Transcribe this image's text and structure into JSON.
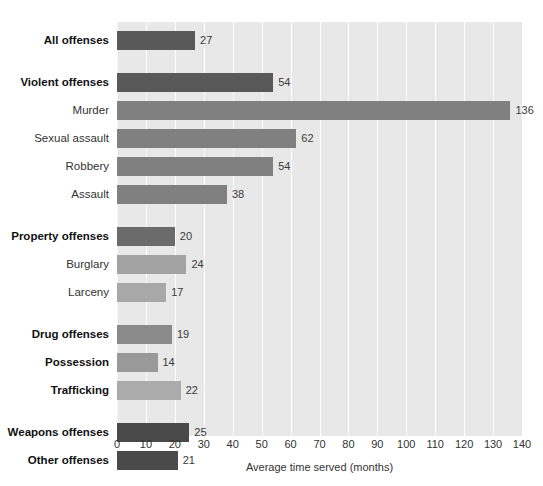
{
  "chart_data": {
    "type": "bar",
    "orientation": "horizontal",
    "title": "",
    "xlabel": "Average time served (months)",
    "ylabel": "",
    "xlim": [
      0,
      140
    ],
    "xticks": [
      0,
      10,
      20,
      30,
      40,
      50,
      60,
      70,
      80,
      90,
      100,
      110,
      120,
      130,
      140
    ],
    "grid": true,
    "legend": "none",
    "categories": [
      "All offenses",
      "Violent offenses",
      "Murder",
      "Sexual assault",
      "Robbery",
      "Assault",
      "Property offenses",
      "Burglary",
      "Larceny",
      "Drug offenses",
      "Possession",
      "Trafficking",
      "Weapons offenses",
      "Other offenses"
    ],
    "values": [
      27,
      54,
      136,
      62,
      54,
      38,
      20,
      24,
      17,
      19,
      14,
      22,
      25,
      21
    ],
    "bars": [
      {
        "label": "All offenses",
        "value": 27,
        "bold": true,
        "color": "#595959",
        "group": 0
      },
      {
        "label": "Violent offenses",
        "value": 54,
        "bold": true,
        "color": "#595959",
        "group": 1
      },
      {
        "label": "Murder",
        "value": 136,
        "bold": false,
        "color": "#808080",
        "group": 1
      },
      {
        "label": "Sexual assault",
        "value": 62,
        "bold": false,
        "color": "#808080",
        "group": 1
      },
      {
        "label": "Robbery",
        "value": 54,
        "bold": false,
        "color": "#808080",
        "group": 1
      },
      {
        "label": "Assault",
        "value": 38,
        "bold": false,
        "color": "#808080",
        "group": 1
      },
      {
        "label": "Property offenses",
        "value": 20,
        "bold": true,
        "color": "#6b6b6b",
        "group": 2
      },
      {
        "label": "Burglary",
        "value": 24,
        "bold": false,
        "color": "#a3a3a3",
        "group": 2
      },
      {
        "label": "Larceny",
        "value": 17,
        "bold": false,
        "color": "#a8a8a8",
        "group": 2
      },
      {
        "label": "Drug offenses",
        "value": 19,
        "bold": true,
        "color": "#8a8a8a",
        "group": 3
      },
      {
        "label": "Possession",
        "value": 14,
        "bold": true,
        "color": "#999999",
        "group": 3
      },
      {
        "label": "Trafficking",
        "value": 22,
        "bold": true,
        "color": "#ababab",
        "group": 3
      },
      {
        "label": "Weapons offenses",
        "value": 25,
        "bold": true,
        "color": "#4a4a4a",
        "group": 4
      },
      {
        "label": "Other offenses",
        "value": 21,
        "bold": true,
        "color": "#4a4a4a",
        "group": 4
      }
    ],
    "colors": {
      "plot_background": "#e8e8e8",
      "gridline": "#ffffff",
      "page_background": "#ffffff",
      "text": "#333333"
    }
  }
}
